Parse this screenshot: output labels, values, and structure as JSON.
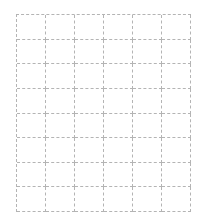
{
  "header": {
    "title": "",
    "title_clipped": true
  },
  "grid": {
    "columns": 6,
    "rows": 8,
    "line_style": "dashed",
    "line_color": "#b4b4b4",
    "background": "#ffffff"
  }
}
